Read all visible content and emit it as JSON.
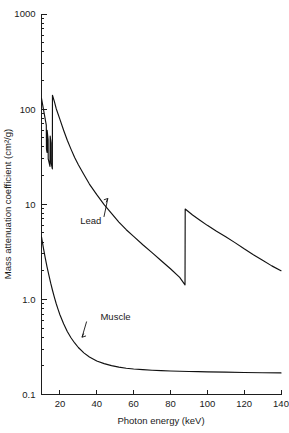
{
  "chart_data": {
    "type": "line",
    "title": "",
    "xlabel": "Photon energy (keV)",
    "ylabel": "Mass attenuation coefficient (cm²/g)",
    "xscale": "linear",
    "yscale": "log",
    "xlim": [
      10,
      140
    ],
    "ylim": [
      0.1,
      1000
    ],
    "grid": false,
    "legend_position": "inline-annotations",
    "xticks": [
      20,
      40,
      60,
      80,
      100,
      120,
      140
    ],
    "xtick_labels": [
      "20",
      "40",
      "60",
      "80",
      "100",
      "120",
      "140"
    ],
    "yticks": [
      0.1,
      1.0,
      10,
      100,
      1000
    ],
    "ytick_labels": [
      "0.1",
      "1.0",
      "10",
      "100",
      "1000"
    ],
    "annotations": [
      {
        "text": "Lead",
        "x_kev": 31,
        "y_value": 6.2,
        "points_to_x_kev": 46,
        "points_to_y_value": 11.5
      },
      {
        "text": "Muscle",
        "x_kev": 42,
        "y_value": 0.6,
        "points_to_x_kev": 32,
        "points_to_y_value": 0.4
      }
    ],
    "series": [
      {
        "name": "Lead",
        "color": "#111111",
        "note": "L-absorption edges near 13-16 keV, K-absorption edge at 88 keV",
        "points": [
          [
            10.0,
            130.0
          ],
          [
            12.6,
            68.0
          ],
          [
            12.7,
            38.0
          ],
          [
            13.0,
            35.0
          ],
          [
            13.05,
            60.0
          ],
          [
            13.6,
            48.0
          ],
          [
            13.65,
            30.0
          ],
          [
            14.6,
            25.0
          ],
          [
            14.7,
            52.0
          ],
          [
            15.2,
            44.0
          ],
          [
            15.25,
            27.0
          ],
          [
            15.9,
            23.5
          ],
          [
            15.95,
            140.0
          ],
          [
            17.0,
            120.0
          ],
          [
            18.0,
            101.0
          ],
          [
            20.0,
            78.0
          ],
          [
            22.0,
            60.0
          ],
          [
            24.0,
            47.0
          ],
          [
            26.0,
            38.0
          ],
          [
            28.0,
            31.0
          ],
          [
            30.0,
            26.0
          ],
          [
            33.0,
            20.5
          ],
          [
            36.0,
            16.3
          ],
          [
            40.0,
            12.6
          ],
          [
            44.0,
            9.9
          ],
          [
            48.0,
            8.0
          ],
          [
            52.0,
            6.5
          ],
          [
            56.0,
            5.4
          ],
          [
            60.0,
            4.6
          ],
          [
            65.0,
            3.75
          ],
          [
            70.0,
            3.1
          ],
          [
            75.0,
            2.55
          ],
          [
            80.0,
            2.1
          ],
          [
            85.0,
            1.7
          ],
          [
            87.9,
            1.42
          ],
          [
            88.0,
            8.9
          ],
          [
            92.0,
            7.7
          ],
          [
            96.0,
            6.8
          ],
          [
            100.0,
            6.0
          ],
          [
            105.0,
            5.2
          ],
          [
            110.0,
            4.55
          ],
          [
            115.0,
            3.95
          ],
          [
            120.0,
            3.4
          ],
          [
            125.0,
            2.95
          ],
          [
            130.0,
            2.58
          ],
          [
            135.0,
            2.25
          ],
          [
            140.0,
            2.0
          ]
        ]
      },
      {
        "name": "Muscle",
        "color": "#111111",
        "note": "Smooth monotonic decrease flattening to about 0.17 cm2/g",
        "points": [
          [
            10.0,
            4.55
          ],
          [
            11.0,
            3.5
          ],
          [
            12.0,
            2.75
          ],
          [
            13.0,
            2.2
          ],
          [
            14.0,
            1.8
          ],
          [
            15.0,
            1.48
          ],
          [
            16.0,
            1.24
          ],
          [
            17.0,
            1.05
          ],
          [
            18.0,
            0.9
          ],
          [
            19.0,
            0.785
          ],
          [
            20.0,
            0.69
          ],
          [
            22.0,
            0.555
          ],
          [
            24.0,
            0.46
          ],
          [
            26.0,
            0.395
          ],
          [
            28.0,
            0.348
          ],
          [
            30.0,
            0.312
          ],
          [
            33.0,
            0.274
          ],
          [
            36.0,
            0.248
          ],
          [
            40.0,
            0.225
          ],
          [
            44.0,
            0.211
          ],
          [
            48.0,
            0.201
          ],
          [
            52.0,
            0.194
          ],
          [
            56.0,
            0.189
          ],
          [
            60.0,
            0.1855
          ],
          [
            65.0,
            0.1825
          ],
          [
            70.0,
            0.18
          ],
          [
            75.0,
            0.1782
          ],
          [
            80.0,
            0.1768
          ],
          [
            85.0,
            0.1756
          ],
          [
            90.0,
            0.1746
          ],
          [
            95.0,
            0.1737
          ],
          [
            100.0,
            0.1729
          ],
          [
            110.0,
            0.1716
          ],
          [
            120.0,
            0.1705
          ],
          [
            130.0,
            0.1695
          ],
          [
            140.0,
            0.1686
          ]
        ]
      }
    ]
  }
}
